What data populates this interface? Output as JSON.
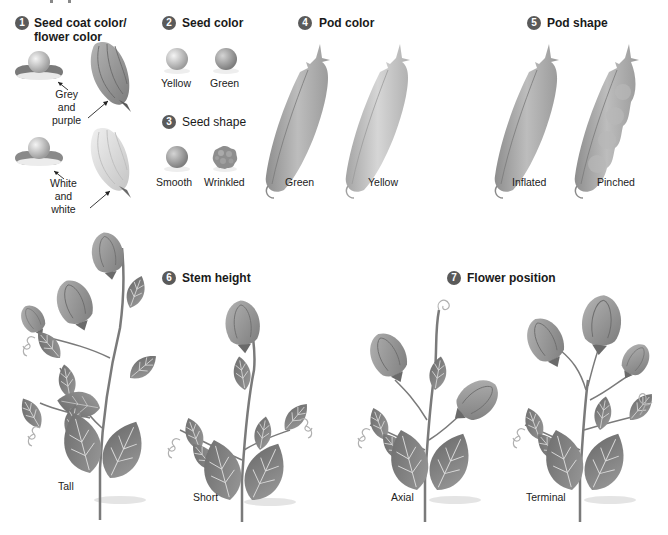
{
  "figure": {
    "title_cutoff": "",
    "sections": [
      {
        "number": "1",
        "title": "Seed coat color/\nflower color",
        "title_line1": "Seed coat color/",
        "title_line2": "flower color",
        "variants": [
          {
            "label_lines": [
              "Grey",
              "and",
              "purple"
            ]
          },
          {
            "label_lines": [
              "White",
              "and",
              "white"
            ]
          }
        ]
      },
      {
        "number": "2",
        "title": "Seed color",
        "variants": [
          {
            "label": "Yellow"
          },
          {
            "label": "Green"
          }
        ]
      },
      {
        "number": "3",
        "title": "Seed shape",
        "variants": [
          {
            "label": "Smooth"
          },
          {
            "label": "Wrinkled"
          }
        ]
      },
      {
        "number": "4",
        "title": "Pod color",
        "variants": [
          {
            "label": "Green"
          },
          {
            "label": "Yellow"
          }
        ]
      },
      {
        "number": "5",
        "title": "Pod shape",
        "variants": [
          {
            "label": "Inflated"
          },
          {
            "label": "Pinched"
          }
        ]
      },
      {
        "number": "6",
        "title": "Stem height",
        "variants": [
          {
            "label": "Tall"
          },
          {
            "label": "Short"
          }
        ]
      },
      {
        "number": "7",
        "title": "Flower position",
        "variants": [
          {
            "label": "Axial"
          },
          {
            "label": "Terminal"
          }
        ]
      }
    ]
  },
  "colors": {
    "badge": "#5a5a5a",
    "pod": "#a8a8a8",
    "leaf": "#7a7a7a",
    "flower": "#9a9a9a",
    "background": "#ffffff"
  }
}
